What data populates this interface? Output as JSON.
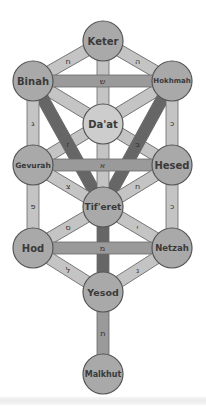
{
  "colors": {
    "node_fill": "#a9a9a9",
    "node_fill_daat": "#cdcdcd",
    "node_stroke": "#555555",
    "path_light": "#c4c4c4",
    "path_mid": "#9a9a9a",
    "path_dark": "#666666",
    "path_stroke": "#6a6a6a"
  },
  "nodes": [
    {
      "id": "keter",
      "label": "Keter",
      "x": 103,
      "y": 41,
      "r": 20,
      "font": 10
    },
    {
      "id": "binah",
      "label": "Binah",
      "x": 33,
      "y": 81,
      "r": 20,
      "font": 10
    },
    {
      "id": "hokhmah",
      "label": "Hokhmah",
      "x": 172,
      "y": 81,
      "r": 20,
      "font": 7
    },
    {
      "id": "daat",
      "label": "Da'at",
      "x": 103,
      "y": 124,
      "r": 20,
      "font": 10,
      "light": true
    },
    {
      "id": "gevurah",
      "label": "Gevurah",
      "x": 33,
      "y": 165,
      "r": 20,
      "font": 7.5
    },
    {
      "id": "hesed",
      "label": "Hesed",
      "x": 172,
      "y": 165,
      "r": 20,
      "font": 10
    },
    {
      "id": "tiferet",
      "label": "Tif'eret",
      "x": 103,
      "y": 207,
      "r": 20,
      "font": 9
    },
    {
      "id": "hod",
      "label": "Hod",
      "x": 33,
      "y": 248,
      "r": 20,
      "font": 10
    },
    {
      "id": "netzah",
      "label": "Netzah",
      "x": 172,
      "y": 248,
      "r": 20,
      "font": 8.5
    },
    {
      "id": "yesod",
      "label": "Yesod",
      "x": 103,
      "y": 292,
      "r": 20,
      "font": 9.5
    },
    {
      "id": "malkhut",
      "label": "Malkhut",
      "x": 103,
      "y": 374,
      "r": 20,
      "font": 8
    }
  ],
  "paths": [
    {
      "from": "binah",
      "to": "hesed",
      "letter": "ק",
      "shade": "light"
    },
    {
      "from": "hokhmah",
      "to": "gevurah",
      "letter": "י",
      "shade": "light"
    },
    {
      "from": "binah",
      "to": "tiferet",
      "letter": "ז",
      "shade": "dark"
    },
    {
      "from": "hokhmah",
      "to": "tiferet",
      "letter": "ב",
      "shade": "dark"
    },
    {
      "from": "keter",
      "to": "tiferet",
      "letter": "ד",
      "shade": "light"
    },
    {
      "from": "keter",
      "to": "binah",
      "letter": "ח",
      "shade": "light"
    },
    {
      "from": "keter",
      "to": "hokhmah",
      "letter": "ה",
      "shade": "light"
    },
    {
      "from": "binah",
      "to": "hokhmah",
      "letter": "ש",
      "shade": "mid"
    },
    {
      "from": "binah",
      "to": "gevurah",
      "letter": "ג",
      "shade": "light"
    },
    {
      "from": "hokhmah",
      "to": "hesed",
      "letter": "כ",
      "shade": "light"
    },
    {
      "from": "gevurah",
      "to": "hesed",
      "letter": "א",
      "shade": "mid"
    },
    {
      "from": "gevurah",
      "to": "tiferet",
      "letter": "צ",
      "shade": "light"
    },
    {
      "from": "hesed",
      "to": "tiferet",
      "letter": "ח",
      "shade": "light"
    },
    {
      "from": "gevurah",
      "to": "hod",
      "letter": "פ",
      "shade": "light"
    },
    {
      "from": "hesed",
      "to": "netzah",
      "letter": "כ",
      "shade": "light"
    },
    {
      "from": "tiferet",
      "to": "hod",
      "letter": "ס",
      "shade": "light"
    },
    {
      "from": "tiferet",
      "to": "netzah",
      "letter": "י",
      "shade": "light"
    },
    {
      "from": "tiferet",
      "to": "yesod",
      "letter": "ן",
      "shade": "dark"
    },
    {
      "from": "hod",
      "to": "netzah",
      "letter": "מ",
      "shade": "mid"
    },
    {
      "from": "hod",
      "to": "yesod",
      "letter": "ל",
      "shade": "light"
    },
    {
      "from": "netzah",
      "to": "yesod",
      "letter": "נ",
      "shade": "light"
    },
    {
      "from": "yesod",
      "to": "malkhut",
      "letter": "ת",
      "shade": "mid"
    }
  ]
}
